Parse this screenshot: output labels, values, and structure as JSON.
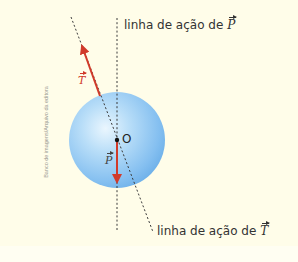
{
  "figure": {
    "type": "physics-force-diagram",
    "background_color": "#fffde9",
    "sphere": {
      "center": [
        117,
        140
      ],
      "radius": 48,
      "color": "#8ec6f0"
    },
    "point": {
      "label": "O",
      "position": [
        117,
        140
      ]
    },
    "forces": [
      {
        "name": "T",
        "symbol": "T",
        "color": "#d13a2a",
        "from": [
          100,
          96
        ],
        "to": [
          81,
          43
        ]
      },
      {
        "name": "P",
        "symbol": "P",
        "color": "#d13a2a",
        "from": [
          117,
          141
        ],
        "to": [
          117,
          185
        ]
      }
    ],
    "lines_of_action": [
      {
        "force": "P",
        "from": [
          117,
          18
        ],
        "to": [
          117,
          232
        ],
        "label_prefix": "linha de ação de ",
        "label_symbol": "P"
      },
      {
        "force": "T",
        "from": [
          71,
          17
        ],
        "to": [
          153,
          232
        ],
        "label_prefix": "linha de ação de ",
        "label_symbol": "T"
      }
    ],
    "credit": "Banco de imagens/Arquivo da editora"
  }
}
